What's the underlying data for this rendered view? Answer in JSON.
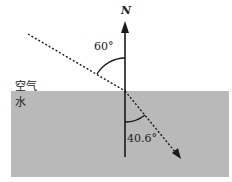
{
  "diagram": {
    "normal_label": "N",
    "media": {
      "upper": "空气",
      "lower": "水"
    },
    "angles": {
      "incidence": "60°",
      "refraction": "40.6°"
    },
    "colors": {
      "water": "#b9b9b9",
      "line": "#1a1a1a",
      "background": "#ffffff"
    }
  }
}
